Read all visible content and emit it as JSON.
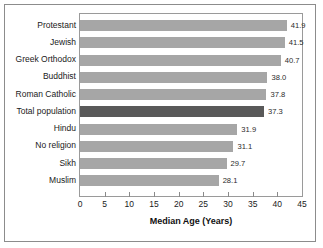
{
  "chart_data": {
    "type": "bar",
    "orientation": "horizontal",
    "title": "",
    "xlabel": "Median Age (Years)",
    "ylabel": "",
    "xlim": [
      0,
      45
    ],
    "xticks": [
      0,
      5,
      10,
      15,
      20,
      25,
      30,
      35,
      40,
      45
    ],
    "grid": false,
    "legend": false,
    "categories": [
      "Protestant",
      "Jewish",
      "Greek Orthodox",
      "Buddhist",
      "Roman Catholic",
      "Total population",
      "Hindu",
      "No religion",
      "Sikh",
      "Muslim"
    ],
    "values": [
      41.9,
      41.5,
      40.7,
      38.0,
      37.8,
      37.3,
      31.9,
      31.1,
      29.7,
      28.1
    ],
    "value_labels": [
      "41.9",
      "41.5",
      "40.7",
      "38.0",
      "37.8",
      "37.3",
      "31.9",
      "31.1",
      "29.7",
      "28.1"
    ],
    "highlighted_category": "Total population",
    "colors": {
      "bar": "#a6a6a6",
      "bar_highlight": "#595959",
      "plot_border": "#9a9a9a",
      "outer_frame": "#8c8c8c",
      "text": "#1a1a1a",
      "background": "#ffffff"
    },
    "xtick_labels": [
      "0",
      "5",
      "10",
      "15",
      "20",
      "25",
      "30",
      "35",
      "40",
      "45"
    ]
  }
}
